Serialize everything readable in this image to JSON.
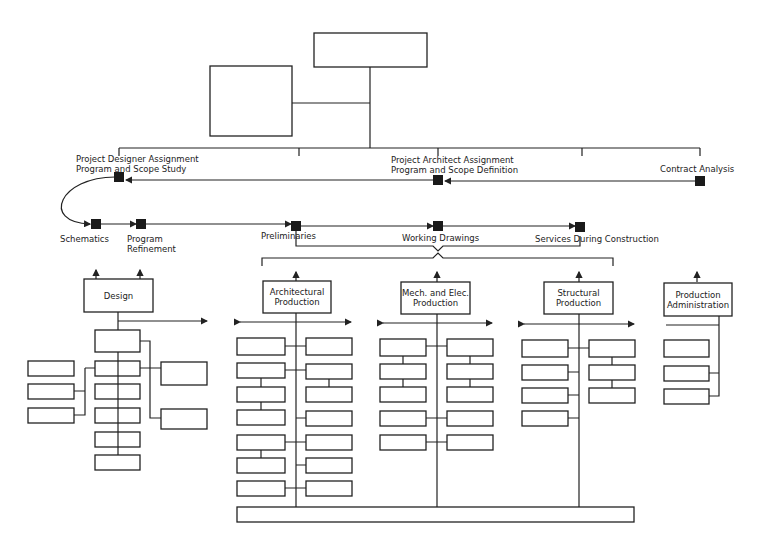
{
  "top_boxes": [
    {
      "name": "top-box",
      "x": 314,
      "y": 33,
      "w": 113,
      "h": 34
    },
    {
      "name": "side-box",
      "x": 210,
      "y": 66,
      "w": 82,
      "h": 70
    }
  ],
  "milestones": {
    "project_designer": "Project Designer Assignment\nProgram and Scope Study",
    "project_architect": "Project Architect Assignment\nProgram and Scope Definition",
    "contract_analysis": "Contract Analysis",
    "schematics": "Schematics",
    "program_refinement": "Program\nRefinement",
    "preliminaries": "Preliminaries",
    "working_drawings": "Working Drawings",
    "services": "Services During Construction"
  },
  "departments": {
    "design": "Design",
    "architectural": "Architectural\nProduction",
    "mech_elec": "Mech. and Elec.\nProduction",
    "structural": "Structural\nProduction",
    "admin": "Production\nAdministration"
  },
  "nodes": [
    [
      119,
      177
    ],
    [
      438,
      180
    ],
    [
      700,
      181
    ],
    [
      96,
      224
    ],
    [
      141,
      224
    ],
    [
      296,
      226
    ],
    [
      438,
      226
    ],
    [
      580,
      227
    ]
  ],
  "empty_boxes": [
    [
      95,
      330,
      45,
      22
    ],
    [
      95,
      361,
      45,
      15
    ],
    [
      95,
      384,
      45,
      15
    ],
    [
      95,
      408,
      45,
      15
    ],
    [
      95,
      432,
      45,
      15
    ],
    [
      95,
      455,
      45,
      15
    ],
    [
      28,
      361,
      46,
      15
    ],
    [
      28,
      384,
      46,
      15
    ],
    [
      28,
      408,
      46,
      15
    ],
    [
      161,
      362,
      46,
      23
    ],
    [
      161,
      409,
      46,
      20
    ],
    [
      237,
      338,
      48,
      17
    ],
    [
      237,
      363,
      48,
      15
    ],
    [
      237,
      387,
      48,
      15
    ],
    [
      237,
      410,
      48,
      15
    ],
    [
      237,
      435,
      48,
      15
    ],
    [
      237,
      458,
      48,
      15
    ],
    [
      237,
      481,
      48,
      15
    ],
    [
      306,
      338,
      46,
      17
    ],
    [
      306,
      364,
      46,
      15
    ],
    [
      306,
      387,
      46,
      15
    ],
    [
      306,
      411,
      46,
      15
    ],
    [
      306,
      435,
      46,
      15
    ],
    [
      306,
      458,
      46,
      15
    ],
    [
      306,
      481,
      46,
      15
    ],
    [
      380,
      339,
      46,
      17
    ],
    [
      380,
      364,
      46,
      15
    ],
    [
      380,
      387,
      46,
      15
    ],
    [
      380,
      411,
      46,
      15
    ],
    [
      380,
      435,
      46,
      15
    ],
    [
      447,
      339,
      46,
      17
    ],
    [
      447,
      364,
      46,
      15
    ],
    [
      447,
      387,
      46,
      15
    ],
    [
      447,
      411,
      46,
      15
    ],
    [
      447,
      435,
      46,
      15
    ],
    [
      522,
      340,
      46,
      17
    ],
    [
      522,
      365,
      46,
      15
    ],
    [
      522,
      388,
      46,
      15
    ],
    [
      522,
      411,
      46,
      15
    ],
    [
      589,
      340,
      46,
      17
    ],
    [
      589,
      365,
      46,
      15
    ],
    [
      589,
      388,
      46,
      15
    ],
    [
      664,
      340,
      45,
      17
    ],
    [
      664,
      366,
      45,
      15
    ],
    [
      664,
      389,
      45,
      15
    ],
    [
      237,
      507,
      397,
      15
    ]
  ]
}
